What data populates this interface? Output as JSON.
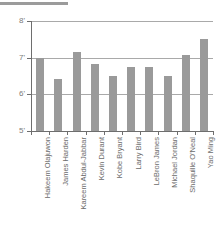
{
  "chart_data": {
    "type": "bar",
    "title": "",
    "xlabel": "",
    "ylabel": "",
    "ylim": [
      5,
      8
    ],
    "y_unit": "feet",
    "grid": true,
    "legend": false,
    "bar_color": "#9a9a9a",
    "axis_color": "#6e6e6e",
    "gridline_color": "#a9a9a9",
    "y_ticks": [
      "8'",
      "7'",
      "6'",
      "5'"
    ],
    "y_tick_values": [
      8,
      7,
      6,
      5
    ],
    "categories": [
      "Hakeem Olajuwon",
      "James Harden",
      "Kareem Abdul-Jabbar",
      "Kevin Durant",
      "Kobe Bryant",
      "Larry Bird",
      "LeBron James",
      "Michael Jordan",
      "Shaquille O'Neal",
      "Yao Ming"
    ],
    "values": [
      7.0,
      6.42,
      7.15,
      6.83,
      6.5,
      6.75,
      6.75,
      6.5,
      7.08,
      7.5
    ]
  },
  "decorations": {
    "top_rule": "horizontal-rule"
  }
}
